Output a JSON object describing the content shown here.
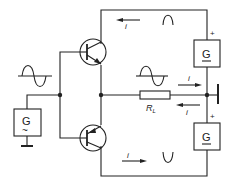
{
  "diagram": {
    "labels": {
      "source_symbol": "G",
      "ac_symbol": "~",
      "plus": "+",
      "load": "R",
      "load_sub": "L",
      "current": "i",
      "upper_half_wave": "∩",
      "lower_half_wave": "V"
    },
    "colors": {
      "line": "#222222",
      "background": "#ffffff"
    }
  }
}
